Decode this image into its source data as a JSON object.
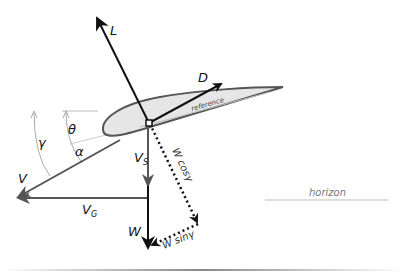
{
  "diagram": {
    "labels": {
      "lift": "L",
      "drag": "D",
      "reference": "reference",
      "velocity": "V",
      "ground_velocity": "V",
      "ground_velocity_sub": "G",
      "sink_velocity": "V",
      "sink_velocity_sub": "S",
      "weight": "W",
      "w_cos": "W cosγ",
      "w_sin": "W sinγ",
      "theta": "θ",
      "alpha": "α",
      "gamma": "γ",
      "horizon": "horizon"
    },
    "colors": {
      "force_line": "#111111",
      "velocity_line": "#555555",
      "airfoil_fill": "#e6e6e6",
      "airfoil_stroke": "#555555",
      "guide_line": "#bbbbbb"
    }
  }
}
